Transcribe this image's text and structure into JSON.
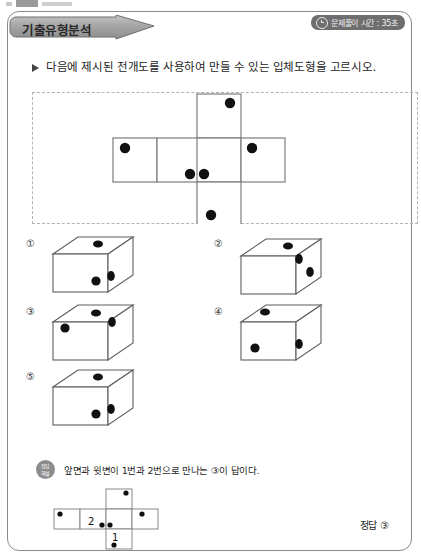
{
  "header": {
    "banner_label": "기출유형분석",
    "timer_icon": "clock-icon",
    "timer_text": "문제풀이 시간 : 35초"
  },
  "prompt": {
    "bullet_icon": "triangle-right-icon",
    "text": "다음에 제시된 전개도를 사용하여 만들 수 있는 입체도형을 고르시오."
  },
  "figure": {
    "caption": "",
    "net": {
      "type": "cube-net",
      "cell": 42,
      "layout": "cross",
      "cells": [
        {
          "id": "top",
          "col": 2,
          "row": 0,
          "dots": 1
        },
        {
          "id": "left",
          "col": 0,
          "row": 1,
          "dots": 1
        },
        {
          "id": "center-left",
          "col": 1,
          "row": 1,
          "dots": 1
        },
        {
          "id": "center",
          "col": 2,
          "row": 1,
          "dots": 1
        },
        {
          "id": "right",
          "col": 3,
          "row": 1,
          "dots": 1
        },
        {
          "id": "bottom",
          "col": 2,
          "row": 2,
          "dots": 1
        }
      ]
    }
  },
  "choices": [
    {
      "number": "①",
      "dots_top": 1,
      "dots_front": 1,
      "dots_right": 1
    },
    {
      "number": "②",
      "dots_top": 1,
      "dots_front": 0,
      "dots_right": 2
    },
    {
      "number": "③",
      "dots_top": 1,
      "dots_front": 1,
      "dots_right": 1
    },
    {
      "number": "④",
      "dots_top": 1,
      "dots_front": 1,
      "dots_right": 1
    },
    {
      "number": "⑤",
      "dots_top": 1,
      "dots_front": 1,
      "dots_right": 1
    }
  ],
  "explanation": {
    "badge_line1": "정답",
    "badge_line2": "해설",
    "text": "앞면과 윗변이 1번과 2번으로 만나는 ③이 답이다.",
    "solution_net_labels": [
      "2",
      "1"
    ]
  },
  "answer": {
    "label": "정답",
    "value": "③"
  },
  "colors": {
    "banner": "#9e9e9e",
    "badge": "#6e6e6e",
    "dot": "#000000",
    "line": "#8a8a8a",
    "dash": "#b3b3b3"
  }
}
